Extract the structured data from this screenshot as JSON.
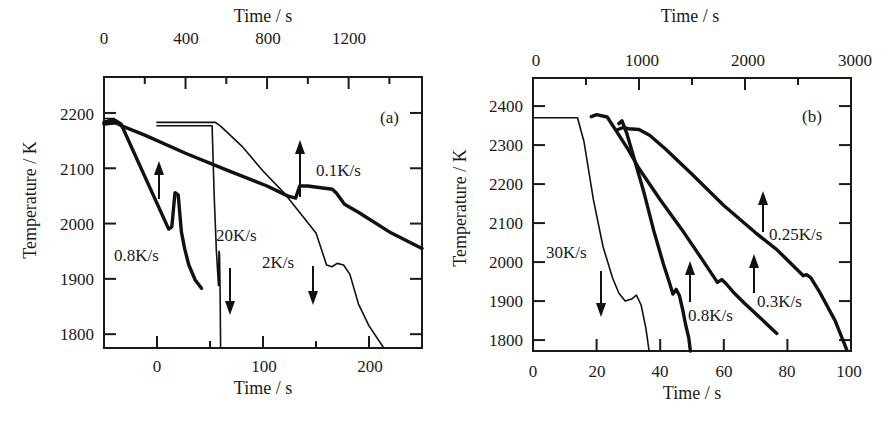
{
  "chart_data": [
    {
      "panel": "(a)",
      "type": "line",
      "frame": {
        "left": 104,
        "right": 422,
        "top": 77,
        "bottom": 348
      },
      "xlabel_bottom": "Time / s",
      "xlabel_top": "Time / s",
      "ylabel": "Temperature / K",
      "xlim_bottom": [
        -50,
        250
      ],
      "xlim_top": [
        0,
        1560
      ],
      "ylim": [
        1775,
        2265
      ],
      "xticks_bottom": [
        0,
        100,
        200
      ],
      "xticks_bottom_minor": [
        50,
        150
      ],
      "xticks_top": [
        0,
        400,
        800,
        1200
      ],
      "xticks_top_minor": [
        200,
        600,
        1000,
        1400
      ],
      "yticks": [
        1800,
        1900,
        2000,
        2100,
        2200
      ],
      "grid": false,
      "series": [
        {
          "name": "0.8K/s",
          "axis": "bottom",
          "weight": "thick",
          "x": [
            -50,
            -45,
            -39,
            -34,
            11,
            14,
            17,
            20,
            23,
            26,
            30,
            36,
            42
          ],
          "y": [
            2183,
            2186,
            2186,
            2180,
            1990,
            1994,
            2056,
            2052,
            1985,
            1955,
            1925,
            1898,
            1883
          ]
        },
        {
          "name": "0.1K/s",
          "axis": "top",
          "weight": "thick",
          "x": [
            0,
            60,
            90,
            200,
            400,
            600,
            800,
            900,
            940,
            960,
            1000,
            1120,
            1140,
            1180,
            1250,
            1400,
            1560
          ],
          "y": [
            2180,
            2182,
            2176,
            2160,
            2127,
            2097,
            2068,
            2050,
            2046,
            2068,
            2068,
            2062,
            2055,
            2035,
            2020,
            1985,
            1955
          ]
        },
        {
          "name": "20K/s",
          "axis": "bottom",
          "weight": "thin",
          "x": [
            0,
            52,
            54,
            56,
            58,
            58.5,
            59,
            59.5,
            60
          ],
          "y": [
            2177,
            2177,
            2050,
            1950,
            1888,
            1950,
            1945,
            1880,
            1775
          ]
        },
        {
          "name": "2K/s",
          "axis": "bottom",
          "weight": "thin",
          "x": [
            0,
            55,
            60,
            80,
            100,
            120,
            150,
            160,
            165,
            170,
            176,
            182,
            190,
            200,
            214
          ],
          "y": [
            2183,
            2183,
            2176,
            2140,
            2095,
            2055,
            1983,
            1925,
            1922,
            1928,
            1925,
            1908,
            1855,
            1815,
            1775
          ]
        },
        {
          "name": "flat-marker",
          "axis": "bottom",
          "weight": "thin",
          "x": [
            -50,
            -40
          ],
          "y": [
            2190,
            2190
          ]
        }
      ],
      "annotations": [
        {
          "text": "(a)",
          "x": 380,
          "y": 123
        },
        {
          "text": "0.1K/s",
          "x": 316,
          "y": 176
        },
        {
          "text": "0.8K/s",
          "x": 114,
          "y": 261
        },
        {
          "text": "20K/s",
          "x": 216,
          "y": 241
        },
        {
          "text": "2K/s",
          "x": 262,
          "y": 268
        }
      ],
      "arrows": [
        {
          "dir": "up",
          "x": 159,
          "y1": 199,
          "y2": 161
        },
        {
          "dir": "up",
          "x": 300,
          "y1": 197,
          "y2": 140
        },
        {
          "dir": "down",
          "x": 230,
          "y1": 268,
          "y2": 315
        },
        {
          "dir": "down",
          "x": 313,
          "y1": 266,
          "y2": 305
        }
      ]
    },
    {
      "panel": "(b)",
      "type": "line",
      "frame": {
        "left": 533,
        "right": 851,
        "top": 78,
        "bottom": 351
      },
      "xlabel_bottom": "Time / s",
      "xlabel_top": "Time / s",
      "ylabel": "Temperature / K",
      "xlim_bottom": [
        0,
        100
      ],
      "xlim_top": [
        0,
        3000
      ],
      "ylim": [
        1772,
        2472
      ],
      "xticks_bottom": [
        0,
        20,
        40,
        60,
        80,
        100
      ],
      "xticks_bottom_minor": [],
      "xticks_top": [
        0,
        1000,
        2000,
        3000
      ],
      "xticks_top_minor": [
        500,
        1500,
        2500
      ],
      "yticks": [
        1800,
        1900,
        2000,
        2100,
        2200,
        2300,
        2400
      ],
      "grid": false,
      "series": [
        {
          "name": "30K/s",
          "axis": "bottom",
          "weight": "thin",
          "x": [
            0,
            14,
            16,
            19,
            22,
            25,
            27,
            29,
            31,
            32.5,
            34,
            35.5,
            36.5
          ],
          "y": [
            2370,
            2370,
            2310,
            2160,
            2040,
            1960,
            1920,
            1900,
            1905,
            1915,
            1890,
            1830,
            1772
          ]
        },
        {
          "name": "0.8K/s",
          "axis": "bottom",
          "weight": "thick",
          "x": [
            27,
            28,
            29.5,
            32,
            35,
            38,
            41,
            43,
            44,
            45,
            46,
            47,
            48,
            49,
            49.5
          ],
          "y": [
            2355,
            2362,
            2330,
            2260,
            2175,
            2080,
            1995,
            1945,
            1918,
            1930,
            1915,
            1880,
            1840,
            1805,
            1772
          ]
        },
        {
          "name": "0.3K/s",
          "axis": "top",
          "weight": "thick",
          "x": [
            550,
            600,
            700,
            800,
            900,
            1000,
            1200,
            1400,
            1600,
            1740,
            1780,
            1820,
            1900,
            2000,
            2150,
            2300
          ],
          "y": [
            2373,
            2378,
            2372,
            2330,
            2288,
            2240,
            2160,
            2085,
            2005,
            1948,
            1955,
            1945,
            1920,
            1893,
            1855,
            1817
          ]
        },
        {
          "name": "0.25K/s",
          "axis": "top",
          "weight": "thick",
          "x": [
            800,
            850,
            900,
            1000,
            1100,
            1250,
            1500,
            1800,
            2100,
            2300,
            2450,
            2550,
            2580,
            2620,
            2700,
            2850,
            2960
          ],
          "y": [
            2340,
            2345,
            2342,
            2340,
            2325,
            2290,
            2225,
            2145,
            2075,
            2032,
            1992,
            1965,
            1968,
            1960,
            1925,
            1850,
            1775
          ]
        }
      ],
      "annotations": [
        {
          "text": "(b)",
          "x": 802,
          "y": 122
        },
        {
          "text": "30K/s",
          "x": 546,
          "y": 258
        },
        {
          "text": "0.25K/s",
          "x": 769,
          "y": 240
        },
        {
          "text": "0.8K/s",
          "x": 690,
          "y": 321
        },
        {
          "text": "0.3K/s",
          "x": 757,
          "y": 307
        },
        {
          "text": "(b)-extra",
          "x": 0,
          "y": 0
        }
      ],
      "arrows": [
        {
          "dir": "down",
          "x": 601,
          "y1": 271,
          "y2": 317
        },
        {
          "dir": "up",
          "x": 690,
          "y1": 302,
          "y2": 261
        },
        {
          "dir": "up",
          "x": 754,
          "y1": 293,
          "y2": 254
        },
        {
          "dir": "up",
          "x": 763,
          "y1": 232,
          "y2": 191
        }
      ]
    }
  ],
  "labels": {
    "a": {
      "top_title": "Time / s",
      "bottom_title": "Time / s",
      "y_title": "Temperature / K",
      "panel": "(a)",
      "top_ticks": [
        "0",
        "400",
        "800",
        "1200"
      ],
      "bottom_ticks": [
        "0",
        "100",
        "200"
      ],
      "y_ticks": [
        "2200",
        "2100",
        "2000",
        "1900",
        "1800"
      ],
      "rates": {
        "r08": "0.8K/s",
        "r01": "0.1K/s",
        "r20": "20K/s",
        "r2": "2K/s"
      }
    },
    "b": {
      "top_title": "Time / s",
      "bottom_title": "Time / s",
      "y_title": "Temperature / K",
      "panel": "(b)",
      "top_ticks": [
        "0",
        "1000",
        "2000",
        "3000"
      ],
      "bottom_ticks": [
        "0",
        "20",
        "40",
        "60",
        "80",
        "100"
      ],
      "y_ticks": [
        "2400",
        "2300",
        "2200",
        "2100",
        "2000",
        "1900",
        "1800"
      ],
      "rates": {
        "r30": "30K/s",
        "r08": "0.8K/s",
        "r03": "0.3K/s",
        "r025": "0.25K/s"
      }
    }
  }
}
